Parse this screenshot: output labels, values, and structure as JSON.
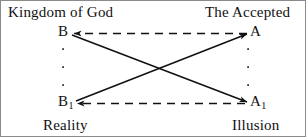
{
  "diagram": {
    "title_hidden": "",
    "background_color": "#ffffff",
    "border_color": "#8a8a8a",
    "line_color": "#111111",
    "corner_labels": {
      "top_left": "Kingdom of God",
      "top_right": "The Accepted",
      "bottom_left": "Reality",
      "bottom_right": "Illusion"
    },
    "nodes": {
      "b": {
        "base": "B",
        "sub": ""
      },
      "a": {
        "base": "A",
        "sub": ""
      },
      "b1": {
        "base": "B",
        "sub": "1"
      },
      "a1": {
        "base": "A",
        "sub": "1"
      }
    },
    "edges": [
      {
        "id": "a-to-b-top",
        "from": "A",
        "to": "B",
        "style": "dashed",
        "arrow_at": "B",
        "orientation": "horizontal"
      },
      {
        "id": "a1-to-b1-bottom",
        "from": "A1",
        "to": "B1",
        "style": "dashed",
        "arrow_at": "B1",
        "orientation": "horizontal"
      },
      {
        "id": "b-to-a1",
        "from": "B",
        "to": "A1",
        "style": "solid",
        "arrow_at": "A1",
        "orientation": "diagonal"
      },
      {
        "id": "b1-to-a",
        "from": "B1",
        "to": "A",
        "style": "solid",
        "arrow_at": "A",
        "orientation": "diagonal"
      }
    ],
    "dot_columns": [
      {
        "id": "left-dots",
        "x": 62,
        "dots_y": [
          48,
          66,
          84
        ]
      },
      {
        "id": "right-dots",
        "x": 247,
        "dots_y": [
          48,
          66,
          84
        ]
      }
    ]
  }
}
